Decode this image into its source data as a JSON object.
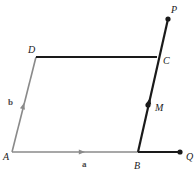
{
  "figure": {
    "background_color": "#ffffff",
    "width": 195,
    "height": 170
  },
  "colors": {
    "vector_gray": "#8a8a8a",
    "edge_black": "#1a1a1a",
    "label_dark": "#1a1a1a",
    "label_gray": "#4d4d4d"
  },
  "points": [
    {
      "id": "A",
      "label": "A",
      "x": 12,
      "y": 152,
      "label_x": 3,
      "label_y": 152,
      "dot": false,
      "style": "italic-serif"
    },
    {
      "id": "B",
      "label": "B",
      "x": 138,
      "y": 152,
      "label_x": 134,
      "label_y": 161,
      "dot": false,
      "style": "italic-serif"
    },
    {
      "id": "C",
      "label": "C",
      "x": 157,
      "y": 57,
      "label_x": 163,
      "label_y": 56,
      "dot": false,
      "style": "italic-serif"
    },
    {
      "id": "D",
      "label": "D",
      "x": 36,
      "y": 57,
      "label_x": 28,
      "label_y": 45,
      "dot": false,
      "style": "italic-serif"
    },
    {
      "id": "M",
      "label": "M",
      "x": 148,
      "y": 105,
      "label_x": 155,
      "label_y": 103,
      "dot": true,
      "style": "italic-serif"
    },
    {
      "id": "P",
      "label": "P",
      "x": 168,
      "y": 19,
      "label_x": 171,
      "label_y": 5,
      "dot": true,
      "style": "italic-serif"
    },
    {
      "id": "Q",
      "label": "Q",
      "x": 180,
      "y": 152,
      "label_x": 186,
      "label_y": 152,
      "dot": true,
      "style": "italic-serif"
    }
  ],
  "segments": [
    {
      "id": "AB",
      "from": "A",
      "to": "B",
      "x1": 12,
      "y1": 152,
      "x2": 138,
      "y2": 152,
      "color": "#8a8a8a",
      "width": 1.6,
      "arrow": true,
      "name": "vector-a-segment"
    },
    {
      "id": "AD",
      "from": "A",
      "to": "D",
      "x1": 12,
      "y1": 152,
      "x2": 36,
      "y2": 57,
      "color": "#8a8a8a",
      "width": 1.6,
      "arrow": true,
      "name": "vector-b-segment"
    },
    {
      "id": "DC",
      "from": "D",
      "to": "C",
      "x1": 36,
      "y1": 57,
      "x2": 157,
      "y2": 57,
      "color": "#1a1a1a",
      "width": 1.8,
      "arrow": false,
      "name": "edge-dc"
    },
    {
      "id": "BP",
      "from": "B",
      "to": "P",
      "x1": 138,
      "y1": 152,
      "x2": 168,
      "y2": 19,
      "color": "#1a1a1a",
      "width": 2.2,
      "arrow": false,
      "name": "ray-bp"
    },
    {
      "id": "BQ",
      "from": "B",
      "to": "Q",
      "x1": 138,
      "y1": 152,
      "x2": 180,
      "y2": 152,
      "color": "#1a1a1a",
      "width": 2.2,
      "arrow": false,
      "name": "ray-bq"
    }
  ],
  "vector_labels": [
    {
      "id": "a",
      "label": "a",
      "x": 82,
      "y": 160,
      "name": "vector-a-label"
    },
    {
      "id": "b",
      "label": "b",
      "x": 8,
      "y": 98,
      "name": "vector-b-label"
    }
  ],
  "arrow_markers": [
    {
      "id": "arrow-a",
      "on": "AB",
      "x": 85,
      "y": 152,
      "angle": 0,
      "color": "#8a8a8a",
      "name": "arrowhead-a"
    },
    {
      "id": "arrow-b",
      "on": "AD",
      "x": 24,
      "y": 103,
      "angle": -75.8,
      "color": "#8a8a8a",
      "name": "arrowhead-b"
    },
    {
      "id": "arrow-m",
      "on": "BP",
      "x": 150,
      "y": 98,
      "angle": -77.3,
      "color": "#1a1a1a",
      "name": "arrowhead-bm"
    }
  ]
}
